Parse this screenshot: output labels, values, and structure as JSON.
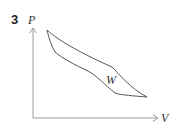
{
  "question_number": "3",
  "diagram": {
    "type": "pv-cycle",
    "y_axis_label": "P",
    "x_axis_label": "V",
    "region_label": "W",
    "colors": {
      "line": "#555555",
      "axis": "#888888",
      "text": "#333333"
    }
  }
}
